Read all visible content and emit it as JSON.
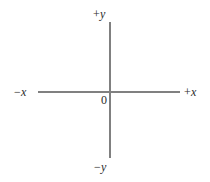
{
  "figure": {
    "background_color": "#ffffff",
    "width": 210,
    "height": 182
  },
  "style": {
    "axis_color": "#808080",
    "axis_stroke_width": 1.2,
    "label_color": "#2b2b2b",
    "label_font_size": 12
  },
  "chart_data": {
    "type": "diagram",
    "subtype": "cartesian-axes",
    "title": "",
    "xlabel": "",
    "ylabel": "",
    "grid": false,
    "legend": null,
    "origin": {
      "label": "0",
      "x": 110,
      "y": 92
    },
    "axes": [
      {
        "name": "x-axis",
        "orientation": "horizontal",
        "x1": 38,
        "y1": 92,
        "x2": 180,
        "y2": 92,
        "negative_label": {
          "sign": "−",
          "variable": "x"
        },
        "positive_label": {
          "sign": "+",
          "variable": "x"
        }
      },
      {
        "name": "y-axis",
        "orientation": "vertical",
        "x1": 110,
        "y1": 22,
        "x2": 110,
        "y2": 158,
        "negative_label": {
          "sign": "−",
          "variable": "y"
        },
        "positive_label": {
          "sign": "+",
          "variable": "y"
        }
      }
    ],
    "data_points": [],
    "annotations": [
      {
        "name": "positive-y",
        "text": "+ y",
        "position": "top"
      },
      {
        "name": "negative-y",
        "text": "− y",
        "position": "bottom"
      },
      {
        "name": "negative-x",
        "text": "− x",
        "position": "left"
      },
      {
        "name": "positive-x",
        "text": "+ x",
        "position": "right"
      },
      {
        "name": "origin",
        "text": "0",
        "position": "center"
      }
    ]
  },
  "labels": {
    "positive_y": {
      "sign": "+",
      "variable": "y"
    },
    "negative_y": {
      "sign": "−",
      "variable": "y"
    },
    "positive_x": {
      "sign": "+",
      "variable": "x"
    },
    "negative_x": {
      "sign": "−",
      "variable": "x"
    },
    "origin": "0"
  }
}
